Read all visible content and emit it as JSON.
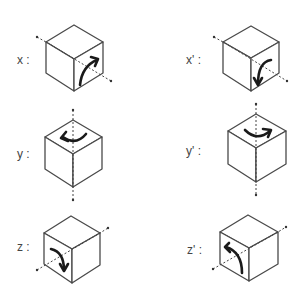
{
  "diagram": {
    "title": "",
    "stroke_color": "#4a4a4a",
    "arrow_color": "#1a1a1a",
    "background": "#ffffff",
    "panels": [
      {
        "id": "x",
        "label": "x :",
        "rotation_axis": "x",
        "direction": "clockwise-up",
        "cube": {
          "top": [
            74,
            25
          ],
          "lt": [
            46,
            42
          ],
          "rt": [
            103,
            42
          ],
          "c": [
            74,
            59
          ],
          "lb": [
            46,
            73
          ],
          "rb": [
            103,
            73
          ],
          "b": [
            74,
            91
          ]
        },
        "label_pos": [
          17,
          64
        ],
        "axis_line": [
          [
            37,
            37
          ],
          [
            46,
            42
          ],
          [
            111,
            81
          ]
        ],
        "arrow_face": "right",
        "arrow": "M80 85 Q 82 66 97 60",
        "arrow_head": [
          [
            91,
            57
          ],
          [
            98,
            59
          ],
          [
            95,
            66
          ]
        ]
      },
      {
        "id": "x-prime",
        "label": "x' :",
        "rotation_axis": "x",
        "direction": "counter-clockwise-down",
        "cube": {
          "top": [
            251,
            26
          ],
          "lt": [
            223,
            42
          ],
          "rt": [
            279,
            42
          ],
          "c": [
            251,
            58
          ],
          "lb": [
            223,
            73
          ],
          "rb": [
            279,
            73
          ],
          "b": [
            251,
            91
          ]
        },
        "label_pos": [
          186,
          64
        ],
        "axis_line": [
          [
            214,
            37
          ],
          [
            223,
            42
          ],
          [
            287,
            81
          ]
        ],
        "arrow_face": "right",
        "arrow": "M271 60 Q 258 62 258 84",
        "arrow_head": [
          [
            254,
            78
          ],
          [
            258,
            85
          ],
          [
            262,
            78
          ]
        ]
      },
      {
        "id": "y",
        "label": "y :",
        "rotation_axis": "y",
        "direction": "counter-clockwise",
        "cube": {
          "top": [
            73,
            120
          ],
          "lt": [
            45,
            137
          ],
          "rt": [
            102,
            137
          ],
          "c": [
            73,
            154
          ],
          "lb": [
            45,
            169
          ],
          "rb": [
            102,
            169
          ],
          "b": [
            73,
            187
          ]
        },
        "label_pos": [
          17,
          158
        ],
        "axis_line": [
          [
            73,
            110
          ],
          [
            73,
            200
          ]
        ],
        "arrow_face": "top",
        "arrow": "M86 134 Q 76 146 63 137",
        "arrow_head": [
          [
            66,
            132
          ],
          [
            61,
            138
          ],
          [
            68,
            141
          ]
        ]
      },
      {
        "id": "y-prime",
        "label": "y' :",
        "rotation_axis": "y",
        "direction": "clockwise",
        "cube": {
          "top": [
            256,
            114
          ],
          "lt": [
            228,
            131
          ],
          "rt": [
            286,
            131
          ],
          "c": [
            256,
            148
          ],
          "lb": [
            228,
            164
          ],
          "rb": [
            286,
            164
          ],
          "b": [
            256,
            182
          ]
        },
        "label_pos": [
          186,
          155
        ],
        "axis_line": [
          [
            256,
            104
          ],
          [
            256,
            195
          ]
        ],
        "arrow_face": "top",
        "arrow": "M245 130 Q 257 142 270 131",
        "arrow_head": [
          [
            263,
            129
          ],
          [
            271,
            130
          ],
          [
            268,
            137
          ]
        ]
      },
      {
        "id": "z",
        "label": "z :",
        "rotation_axis": "z",
        "direction": "clockwise-down",
        "cube": {
          "top": [
            71,
            216
          ],
          "lt": [
            44,
            233
          ],
          "rt": [
            100,
            233
          ],
          "c": [
            72,
            249
          ],
          "lb": [
            44,
            264
          ],
          "rb": [
            100,
            265
          ],
          "b": [
            72,
            283
          ]
        },
        "label_pos": [
          17,
          251
        ],
        "axis_line": [
          [
            37,
            270
          ],
          [
            100,
            233
          ],
          [
            108,
            228
          ]
        ],
        "arrow_face": "front",
        "arrow": "M51 249 Q 64 252 64 270",
        "arrow_head": [
          [
            60,
            264
          ],
          [
            64,
            271
          ],
          [
            68,
            264
          ]
        ]
      },
      {
        "id": "z-prime",
        "label": "z' :",
        "rotation_axis": "z",
        "direction": "counter-clockwise-up",
        "cube": {
          "top": [
            248,
            215
          ],
          "lt": [
            220,
            232
          ],
          "rt": [
            278,
            232
          ],
          "c": [
            249,
            248
          ],
          "lb": [
            220,
            264
          ],
          "rb": [
            278,
            264
          ],
          "b": [
            249,
            281
          ]
        },
        "label_pos": [
          187,
          254
        ],
        "axis_line": [
          [
            213,
            269
          ],
          [
            278,
            232
          ],
          [
            286,
            227
          ]
        ],
        "arrow_face": "front",
        "arrow": "M242 273 Q 242 252 226 247",
        "arrow_head": [
          [
            229,
            243
          ],
          [
            225,
            247
          ],
          [
            230,
            252
          ]
        ]
      }
    ]
  }
}
